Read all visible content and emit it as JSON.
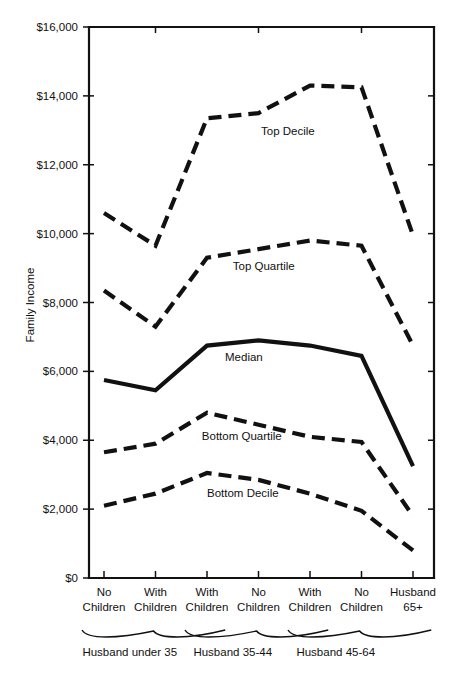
{
  "chart_data": {
    "type": "line",
    "title": "",
    "xlabel": "",
    "ylabel": "Family Income",
    "ylim": [
      0,
      16000
    ],
    "grid": false,
    "legend_position": "inline-labels",
    "y_ticks": [
      0,
      2000,
      4000,
      6000,
      8000,
      10000,
      12000,
      14000,
      16000
    ],
    "y_tick_labels": [
      "$0",
      "$2,000",
      "$4,000",
      "$6,000",
      "$8,000",
      "$10,000",
      "$12,000",
      "$14,000",
      "$16,000"
    ],
    "categories": [
      "No Children",
      "With Children",
      "With Children",
      "No Children",
      "With Children",
      "No Children",
      "Husband 65+"
    ],
    "category_lines": [
      [
        "No",
        "Children"
      ],
      [
        "With",
        "Children"
      ],
      [
        "With",
        "Children"
      ],
      [
        "No",
        "Children"
      ],
      [
        "With",
        "Children"
      ],
      [
        "No",
        "Children"
      ],
      [
        "Husband",
        "65+"
      ]
    ],
    "groups": [
      {
        "label": "Husband under 35",
        "start": 0,
        "end": 1
      },
      {
        "label": "Husband 35-44",
        "start": 2,
        "end": 3
      },
      {
        "label": "Husband 45-64",
        "start": 4,
        "end": 5
      }
    ],
    "series": [
      {
        "name": "Top Decile",
        "style": "dashed",
        "label_x_index": 3.05,
        "label_y": 12850,
        "values": [
          10600,
          9650,
          13350,
          13500,
          14300,
          14250,
          9950
        ]
      },
      {
        "name": "Top Quartile",
        "style": "dashed",
        "label_x_index": 2.5,
        "label_y": 8950,
        "values": [
          8350,
          7300,
          9300,
          9550,
          9800,
          9650,
          6750
        ]
      },
      {
        "name": "Median",
        "style": "solid",
        "label_x_index": 2.35,
        "label_y": 6300,
        "values": [
          5750,
          5450,
          6750,
          6900,
          6750,
          6450,
          3250
        ]
      },
      {
        "name": "Bottom Quartile",
        "style": "dashed",
        "label_x_index": 1.9,
        "label_y": 4000,
        "values": [
          3650,
          3900,
          4800,
          4450,
          4100,
          3950,
          1800
        ]
      },
      {
        "name": "Bottom Decile",
        "style": "dashed",
        "label_x_index": 2.0,
        "label_y": 2350,
        "values": [
          2100,
          2450,
          3050,
          2850,
          2450,
          1950,
          800
        ]
      }
    ]
  }
}
